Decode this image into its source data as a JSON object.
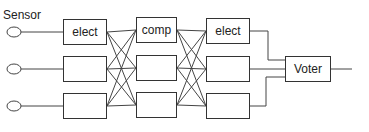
{
  "diagram": {
    "sensor_label": "Sensor",
    "columns": [
      {
        "name": "elect-in",
        "labels": [
          "elect",
          "",
          ""
        ]
      },
      {
        "name": "comp",
        "labels": [
          "comp",
          "",
          ""
        ]
      },
      {
        "name": "elect-out",
        "labels": [
          "elect",
          "",
          ""
        ]
      }
    ],
    "voter_label": "Voter",
    "sensor_count": 3,
    "line_color": "#333333"
  }
}
